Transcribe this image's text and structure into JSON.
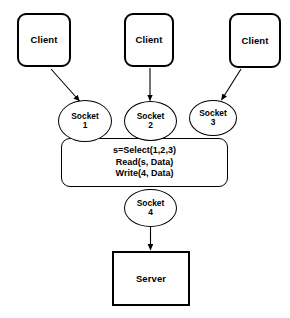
{
  "diagram": {
    "background_color": "#ffffff",
    "stroke_color": "#000000",
    "clients": [
      {
        "id": "client-1",
        "label": "Client"
      },
      {
        "id": "client-2",
        "label": "Client"
      },
      {
        "id": "client-3",
        "label": "Client"
      }
    ],
    "sockets": [
      {
        "id": "socket-1",
        "name": "Socket",
        "number": "1"
      },
      {
        "id": "socket-2",
        "name": "Socket",
        "number": "2"
      },
      {
        "id": "socket-3",
        "name": "Socket",
        "number": "3"
      },
      {
        "id": "socket-4",
        "name": "Socket",
        "number": "4"
      }
    ],
    "select_box": {
      "lines": [
        "s=Select(1,2,3)",
        "Read(s, Data)",
        "Write(4, Data)"
      ]
    },
    "server": {
      "id": "server-box",
      "label": "Server"
    },
    "edges": [
      {
        "id": "edge-client1-socket1",
        "from": "client-1",
        "to": "socket-1"
      },
      {
        "id": "edge-client2-socket2",
        "from": "client-2",
        "to": "socket-2"
      },
      {
        "id": "edge-client3-socket3",
        "from": "client-3",
        "to": "socket-3"
      },
      {
        "id": "edge-socket4-server",
        "from": "socket-4",
        "to": "server-box"
      }
    ]
  }
}
